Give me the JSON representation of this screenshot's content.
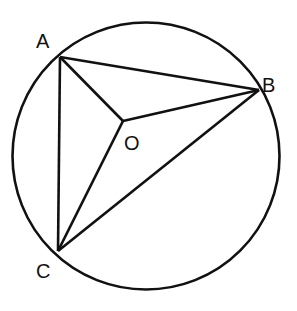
{
  "diagram": {
    "type": "geometry",
    "colors": {
      "stroke": "#111111",
      "background": "#ffffff"
    },
    "circle": {
      "center_label": "O",
      "cx": 146,
      "cy": 156,
      "r": 133
    },
    "points": {
      "A": {
        "label": "A",
        "x": 60,
        "y": 57
      },
      "B": {
        "label": "B",
        "x": 259,
        "y": 90
      },
      "C": {
        "label": "C",
        "x": 58,
        "y": 251
      },
      "O": {
        "label": "O",
        "x": 123,
        "y": 121
      }
    },
    "segments": [
      "AB",
      "BC",
      "CA",
      "OA",
      "OB",
      "OC"
    ]
  }
}
